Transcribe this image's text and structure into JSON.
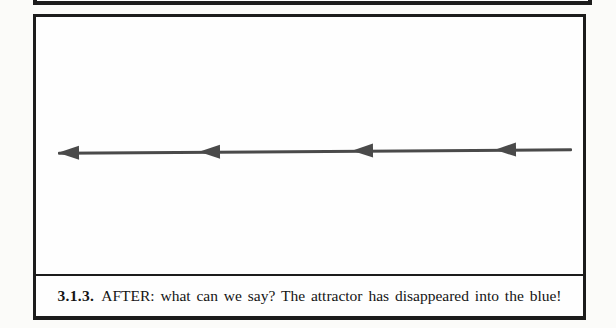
{
  "figure": {
    "caption": {
      "number": "3.1.3.",
      "text": "AFTER: what can we say? The attractor has disappeared into the blue!"
    },
    "diagram": {
      "type": "phase-line",
      "description": "horizontal flow line with leftward arrowheads",
      "arrow_direction": "left",
      "arrowhead_count": 4,
      "arrowhead_tips_x": [
        0,
        141,
        294,
        437
      ],
      "line_length": 514,
      "arrow_color": "#4a4a4a",
      "frame_color": "#1c1c1c"
    }
  }
}
